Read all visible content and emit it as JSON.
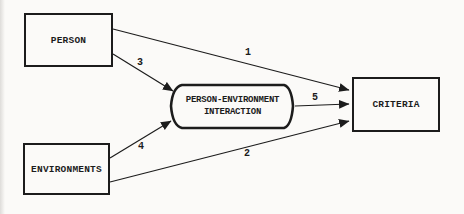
{
  "diagram": {
    "nodes": {
      "person": {
        "label": "PERSON"
      },
      "environments": {
        "label": "ENVIRONMENTS"
      },
      "interaction": {
        "label_line1": "PERSON-ENVIRONMENT",
        "label_line2": "INTERACTION"
      },
      "criteria": {
        "label": "CRITERIA"
      }
    },
    "arrows": [
      {
        "label": "1",
        "from": "person",
        "to": "criteria"
      },
      {
        "label": "2",
        "from": "environments",
        "to": "criteria"
      },
      {
        "label": "3",
        "from": "person",
        "to": "interaction"
      },
      {
        "label": "4",
        "from": "environments",
        "to": "interaction"
      },
      {
        "label": "5",
        "from": "interaction",
        "to": "criteria"
      }
    ],
    "colors": {
      "ink": "#1c1c1c",
      "paper": "#fbfaf8"
    }
  }
}
